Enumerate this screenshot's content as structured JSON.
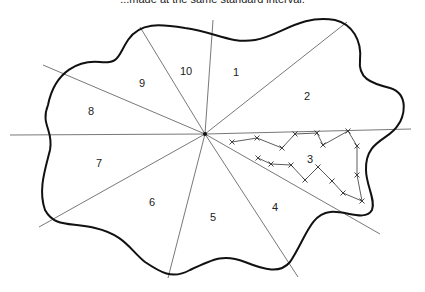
{
  "caption": "...made at the same standard interval.",
  "diagram": {
    "center": {
      "x": 205,
      "y": 134
    },
    "rays": [
      {
        "x": 213,
        "y": 20
      },
      {
        "x": 347,
        "y": 22
      },
      {
        "x": 411,
        "y": 129
      },
      {
        "x": 380,
        "y": 234
      },
      {
        "x": 298,
        "y": 277
      },
      {
        "x": 168,
        "y": 278
      },
      {
        "x": 39,
        "y": 227
      },
      {
        "x": 10,
        "y": 135
      },
      {
        "x": 43,
        "y": 65
      },
      {
        "x": 140,
        "y": 27
      }
    ],
    "sectors": [
      {
        "label": "1",
        "x": 236,
        "y": 76
      },
      {
        "label": "2",
        "x": 307,
        "y": 100
      },
      {
        "label": "3",
        "x": 310,
        "y": 163
      },
      {
        "label": "4",
        "x": 275,
        "y": 211
      },
      {
        "label": "5",
        "x": 213,
        "y": 221
      },
      {
        "label": "6",
        "x": 152,
        "y": 206
      },
      {
        "label": "7",
        "x": 99,
        "y": 167
      },
      {
        "label": "8",
        "x": 91,
        "y": 115
      },
      {
        "label": "9",
        "x": 142,
        "y": 87
      },
      {
        "label": "10",
        "x": 186,
        "y": 75
      }
    ],
    "traverse_points": [
      [
        232,
        142
      ],
      [
        257,
        138
      ],
      [
        282,
        148
      ],
      [
        295,
        134
      ],
      [
        317,
        133
      ],
      [
        323,
        145
      ],
      [
        348,
        131
      ],
      [
        357,
        146
      ],
      [
        357,
        175
      ],
      [
        362,
        201
      ],
      [
        343,
        193
      ],
      [
        332,
        181
      ],
      [
        318,
        167
      ],
      [
        305,
        180
      ],
      [
        291,
        165
      ],
      [
        271,
        164
      ],
      [
        258,
        158
      ]
    ],
    "colors": {
      "outline": "#111111",
      "rays": "#555555",
      "traverse": "#333333"
    }
  }
}
